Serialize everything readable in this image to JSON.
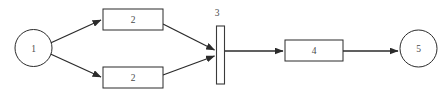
{
  "diagram": {
    "type": "flow-network",
    "background_color": "#ffffff",
    "line_color": "#2b2b2b",
    "text_color": "#4a4a4a",
    "nodes": [
      {
        "id": "n1",
        "label": "1",
        "shape": "circle",
        "cx": 33.5,
        "cy": 48,
        "r": 18.5
      },
      {
        "id": "n2top",
        "label": "2",
        "shape": "rectangle",
        "x": 103,
        "y": 9,
        "w": 60,
        "h": 21
      },
      {
        "id": "n2bottom",
        "label": "2",
        "shape": "rectangle",
        "x": 103,
        "y": 67,
        "w": 60,
        "h": 21
      },
      {
        "id": "n3",
        "label": "3",
        "shape": "vertical-bar",
        "x": 216.5,
        "y": 26,
        "w": 8,
        "h": 58,
        "label_x": 217,
        "label_y": 13
      },
      {
        "id": "n4",
        "label": "4",
        "shape": "rectangle",
        "x": 285,
        "y": 40,
        "w": 58,
        "h": 21
      },
      {
        "id": "n5",
        "label": "5",
        "shape": "circle",
        "cx": 418.5,
        "cy": 48.5,
        "r": 18.5
      }
    ],
    "edges": [
      {
        "id": "e1",
        "from": "n1",
        "to": "n2top",
        "x1": 50.5,
        "y1": 43,
        "x2": 101,
        "y2": 20
      },
      {
        "id": "e2",
        "from": "n1",
        "to": "n2bottom",
        "x1": 50.5,
        "y1": 54,
        "x2": 101,
        "y2": 77
      },
      {
        "id": "e3",
        "from": "n2top",
        "to": "n3",
        "x1": 163,
        "y1": 24,
        "x2": 214.5,
        "y2": 50
      },
      {
        "id": "e4",
        "from": "n2bottom",
        "to": "n3",
        "x1": 163,
        "y1": 75,
        "x2": 214.5,
        "y2": 56
      },
      {
        "id": "e5",
        "from": "n3",
        "to": "n4",
        "x1": 224.5,
        "y1": 51,
        "x2": 283,
        "y2": 51
      },
      {
        "id": "e6",
        "from": "n4",
        "to": "n5",
        "x1": 343,
        "y1": 51,
        "x2": 398,
        "y2": 51
      }
    ]
  }
}
